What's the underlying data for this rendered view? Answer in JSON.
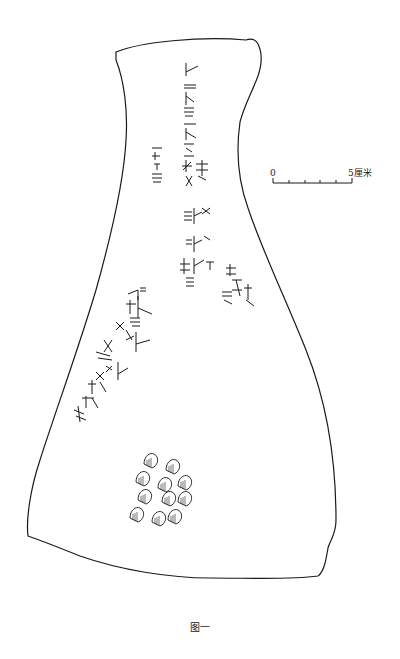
{
  "figure": {
    "caption": "图一",
    "stroke_color": "#1a1a1a",
    "background": "#ffffff"
  },
  "scale_bar": {
    "start_label": "0",
    "end_label": "5厘米",
    "ticks": 6
  },
  "features": {
    "inscription_columns": 6,
    "drill_pits": 11
  }
}
